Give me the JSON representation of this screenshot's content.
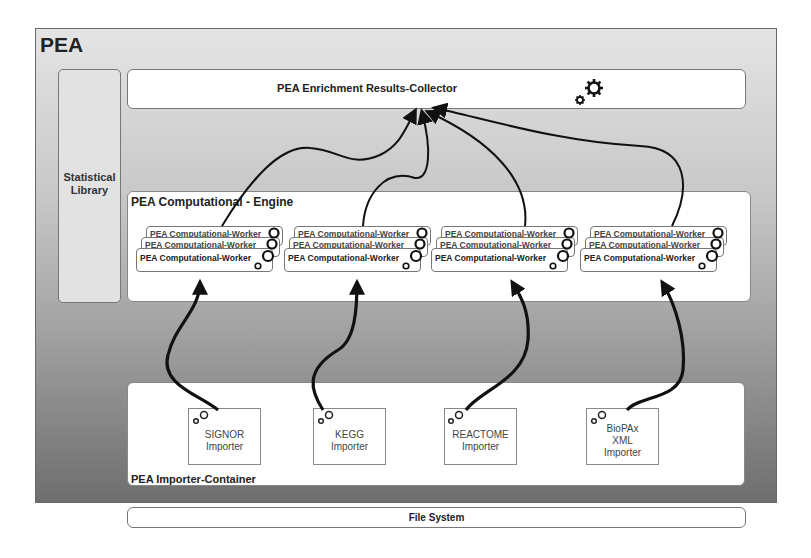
{
  "outer": {
    "title": "PEA"
  },
  "statistical_library": {
    "line1": "Statistical",
    "line2": "Library"
  },
  "collector": {
    "label": "PEA Enrichment Results-Collector",
    "icon": "gears-icon"
  },
  "engine": {
    "label": "PEA Computational - Engine",
    "worker_groups": [
      {
        "workers": [
          "PEA Computational-Worker",
          "PEA Computational-Worker",
          "PEA Computational-Worker"
        ]
      },
      {
        "workers": [
          "PEA Computational-Worker",
          "PEA Computational-Worker",
          "PEA Computational-Worker"
        ]
      },
      {
        "workers": [
          "PEA Computational-Worker",
          "PEA Computational-Worker",
          "PEA Computational-Worker"
        ]
      },
      {
        "workers": [
          "PEA Computational-Worker",
          "PEA Computational-Worker",
          "PEA Computational-Worker"
        ]
      }
    ]
  },
  "importer_container": {
    "label": "PEA Importer-Container",
    "importers": [
      {
        "line1": "SIGNOR",
        "line2": "Importer",
        "line3": ""
      },
      {
        "line1": "KEGG",
        "line2": "Importer",
        "line3": ""
      },
      {
        "line1": "REACTOME",
        "line2": "Importer",
        "line3": ""
      },
      {
        "line1": "BioPAx",
        "line2": "XML",
        "line3": "Importer"
      }
    ]
  },
  "file_system": {
    "label": "File System"
  },
  "colors": {
    "arrow": "#111111",
    "box_border": "#777777",
    "background_top": "#e4e4e4",
    "background_bottom": "#6e6e6e"
  }
}
